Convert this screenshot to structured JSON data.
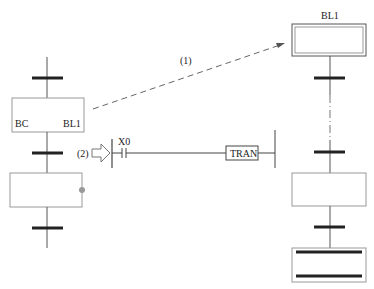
{
  "diagram": {
    "type": "sfc-macro-step-call",
    "colors": {
      "line": "#555555",
      "bar": "#222222",
      "box_border": "#999999",
      "dot": "#999999",
      "arrow": "#555555"
    },
    "left_chart": {
      "step_box": {
        "left_label": "BC",
        "right_label": "BL1"
      },
      "active_step_indicator": "gray-dot"
    },
    "right_chart": {
      "title": "BL1",
      "initial_step": "double-border-box",
      "final_step": "double-bar-box"
    },
    "annotations": {
      "arrow_1_label": "(1)",
      "arrow_2_label": "(2)"
    },
    "ladder_rung": {
      "contact_label": "X0",
      "coil_label": "TRAN"
    }
  }
}
